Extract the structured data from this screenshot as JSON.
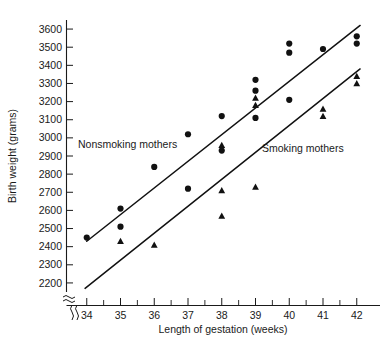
{
  "figure": {
    "title": "",
    "y_axis_label": "Birth weight (grams)",
    "x_axis_label": "Length of gestation (weeks)"
  },
  "annotations": {
    "nonsmoking_label": "Nonsmoking mothers",
    "smoking_label": "Smoking mothers"
  },
  "colors": {
    "marker": "#111111",
    "line": "#111111",
    "axis": "#1a1a1a",
    "background": "#ffffff"
  },
  "chart_data": {
    "type": "scatter",
    "title": "",
    "xlabel": "Length of gestation (weeks)",
    "ylabel": "Birth weight (grams)",
    "xlim": [
      33.4,
      42.6
    ],
    "ylim": [
      2150,
      3650
    ],
    "grid": false,
    "legend": "in-plot annotations",
    "axis_break_y": true,
    "xticks": [
      34,
      35,
      36,
      37,
      38,
      39,
      40,
      41,
      42
    ],
    "xtick_labels": [
      "34",
      "35",
      "36",
      "37",
      "38",
      "39",
      "40",
      "41",
      "42"
    ],
    "yticks": [
      2200,
      2300,
      2400,
      2500,
      2600,
      2700,
      2800,
      2900,
      3000,
      3100,
      3200,
      3300,
      3400,
      3500,
      3600
    ],
    "ytick_labels": [
      "2200",
      "2300",
      "2400",
      "2500",
      "2600",
      "2700",
      "2800",
      "2900",
      "3000",
      "3100",
      "3200",
      "3300",
      "3400",
      "3500",
      "3600"
    ],
    "series": [
      {
        "name": "Nonsmoking mothers",
        "marker": "circle",
        "points": [
          [
            34,
            2450
          ],
          [
            35,
            2610
          ],
          [
            35,
            2510
          ],
          [
            36,
            2840
          ],
          [
            37,
            3020
          ],
          [
            37,
            2720
          ],
          [
            38,
            3120
          ],
          [
            38,
            2930
          ],
          [
            39,
            3320
          ],
          [
            39,
            3260
          ],
          [
            39,
            3110
          ],
          [
            40,
            3520
          ],
          [
            40,
            3470
          ],
          [
            40,
            3210
          ],
          [
            41,
            3490
          ],
          [
            42,
            3560
          ],
          [
            42,
            3520
          ]
        ],
        "fit_line": {
          "x_start": 34.0,
          "y_start": 2430,
          "x_end": 42.1,
          "y_end": 3620
        }
      },
      {
        "name": "Smoking mothers",
        "marker": "triangle",
        "points": [
          [
            35,
            2430
          ],
          [
            36,
            2410
          ],
          [
            38,
            2960
          ],
          [
            38,
            2710
          ],
          [
            38,
            2570
          ],
          [
            39,
            3220
          ],
          [
            39,
            3180
          ],
          [
            39,
            2730
          ],
          [
            41,
            3160
          ],
          [
            41,
            3120
          ],
          [
            42,
            3340
          ],
          [
            42,
            3300
          ]
        ],
        "fit_line": {
          "x_start": 33.95,
          "y_start": 2170,
          "x_end": 42.1,
          "y_end": 3380
        }
      }
    ]
  }
}
